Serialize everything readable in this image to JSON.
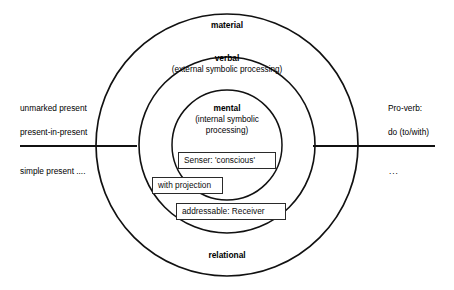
{
  "diagram": {
    "canvas": {
      "width": 454,
      "height": 290,
      "background": "#ffffff"
    },
    "stroke_color": "#111111",
    "rings": [
      {
        "id": "outer",
        "name": "material",
        "subtitle": "",
        "label_x": 227,
        "label_y": 20,
        "cx": 227,
        "cy": 145,
        "r": 131,
        "stroke_width": 1.7
      },
      {
        "id": "middle",
        "name": "verbal",
        "subtitle": "(external symbolic processing)",
        "label_x": 227,
        "label_y": 53,
        "cx": 227,
        "cy": 145,
        "r": 88,
        "stroke_width": 1.6
      },
      {
        "id": "inner",
        "name": "mental",
        "subtitle": "(internal symbolic\nprocessing)",
        "label_x": 227,
        "label_y": 103,
        "cx": 227,
        "cy": 145,
        "r": 55,
        "stroke_width": 1.5
      }
    ],
    "bottom_label": {
      "text": "relational",
      "x": 227,
      "y": 250
    },
    "axis": {
      "y": 146,
      "left_start": 20,
      "left_end": 137,
      "right_start": 313,
      "right_end": 435
    },
    "left_labels": [
      {
        "text": "unmarked present",
        "x": 20,
        "y": 103
      },
      {
        "text": "present-in-present",
        "x": 20,
        "y": 127
      },
      {
        "text": "simple present ....",
        "x": 20,
        "y": 166
      }
    ],
    "right_labels": [
      {
        "text": "Pro-verb:",
        "x": 388,
        "y": 103
      },
      {
        "text": "do (to/with)",
        "x": 388,
        "y": 127
      },
      {
        "text": "...",
        "x": 389,
        "y": 166
      }
    ],
    "callout_boxes": [
      {
        "id": "senser",
        "text": "Senser: 'conscious'",
        "x": 178,
        "y": 152,
        "width": 98,
        "height": 17
      },
      {
        "id": "with-projection",
        "text": "with projection",
        "x": 152,
        "y": 177,
        "width": 71,
        "height": 17
      },
      {
        "id": "addressable",
        "text": "addressable: Receiver",
        "x": 176,
        "y": 203,
        "width": 110,
        "height": 17
      }
    ]
  }
}
